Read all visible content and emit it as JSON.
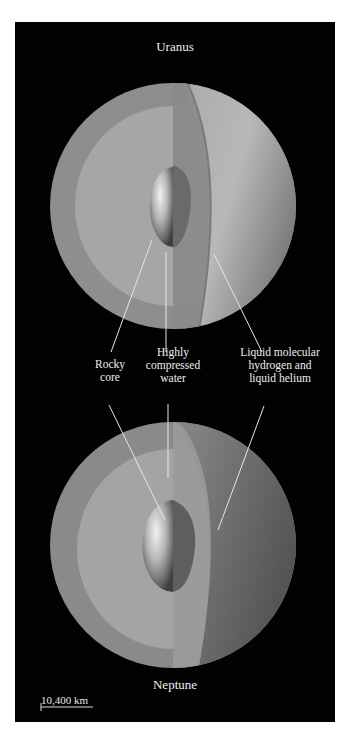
{
  "planets": [
    {
      "name": "Uranus"
    },
    {
      "name": "Neptune"
    }
  ],
  "labels": {
    "rocky_core": "Rocky\ncore",
    "water": "Highly\ncompressed\nwater",
    "hydrogen": "Liquid molecular\nhydrogen and\nliquid helium"
  },
  "labels_lines": {
    "rocky_core": [
      "Rocky",
      "core"
    ],
    "water": [
      "Highly",
      "compressed",
      "water"
    ],
    "hydrogen": [
      "Liquid molecular",
      "hydrogen and",
      "liquid helium"
    ]
  },
  "scale_bar": {
    "label": "10,400 km"
  },
  "colors": {
    "background": "#020202",
    "text": "#eeeeee",
    "outer_layer": "#8f8f8f",
    "water_layer": "#a9a9a9",
    "core_light": "#e6e6e6",
    "core_dark": "#4a4a4a"
  }
}
